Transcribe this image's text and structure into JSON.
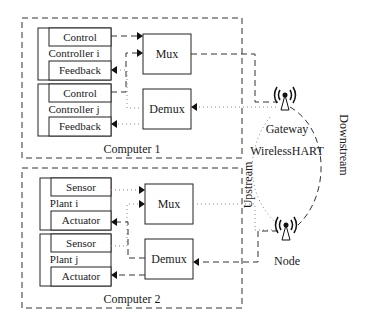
{
  "diagram": {
    "computer1": {
      "label": "Computer 1",
      "controllers": [
        {
          "name": "Controller i",
          "top": "Control",
          "bottom": "Feedback"
        },
        {
          "name": "Controller j",
          "top": "Control",
          "bottom": "Feedback"
        }
      ],
      "mux": "Mux",
      "demux": "Demux"
    },
    "computer2": {
      "label": "Computer 2",
      "plants": [
        {
          "name": "Plant i",
          "top": "Sensor",
          "bottom": "Actuator"
        },
        {
          "name": "Plant j",
          "top": "Sensor",
          "bottom": "Actuator"
        }
      ],
      "mux": "Mux",
      "demux": "Demux"
    },
    "network": {
      "gateway": "Gateway",
      "name": "WirelessHART",
      "node": "Node",
      "upstream": "Upstream",
      "downstream": "Downstream"
    }
  }
}
